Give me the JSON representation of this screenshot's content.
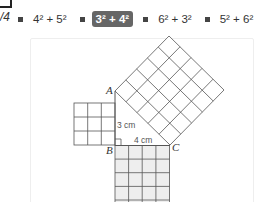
{
  "question": {
    "number_fragment": "/4"
  },
  "options": [
    {
      "label": "4² + 5²",
      "selected": false
    },
    {
      "label": "3² + 4²",
      "selected": true
    },
    {
      "label": "6² + 3²",
      "selected": false
    },
    {
      "label": "5² + 6²",
      "selected": false
    }
  ],
  "diagram": {
    "vertices": {
      "A": "A",
      "B": "B",
      "C": "C"
    },
    "side_labels": {
      "AB": "3 cm",
      "BC": "4 cm"
    },
    "squares": {
      "left_grid": 3,
      "bottom_grid": 4,
      "hypotenuse_grid": 5
    },
    "colors": {
      "line": "#555555",
      "bottom_fill": "#eeeeee",
      "selected_option_bg": "#666666"
    }
  }
}
